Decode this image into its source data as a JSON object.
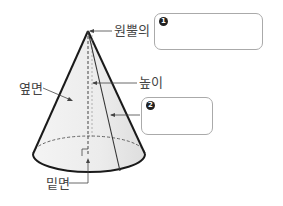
{
  "diagram": {
    "labels": {
      "apex": "원뿔의",
      "lateral_face": "옆면",
      "height": "높이",
      "base": "밑면"
    },
    "answer_boxes": [
      {
        "number": "1",
        "value": ""
      },
      {
        "number": "2",
        "value": ""
      }
    ],
    "colors": {
      "outline": "#1a1a1a",
      "fill": "#ebebeb",
      "text": "#444444",
      "box_border": "#aaaaaa"
    }
  }
}
